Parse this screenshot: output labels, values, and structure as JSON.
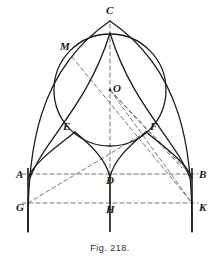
{
  "figure": {
    "caption": "Fig. 218.",
    "canvas": {
      "width": 220,
      "height": 269
    },
    "colors": {
      "ink": "#1a1a1a",
      "construction": "#666666",
      "background": "#ffffff"
    },
    "stroke": {
      "solid_width": 1.3,
      "dashed_width": 0.9,
      "dash_pattern": "4,3"
    }
  },
  "points": [
    {
      "id": "C",
      "label": "C",
      "x": 110,
      "y": 21,
      "label_x": 106,
      "label_y": 14,
      "role": "apex"
    },
    {
      "id": "M",
      "label": "M",
      "x": 72,
      "y": 57,
      "label_x": 60,
      "label_y": 50,
      "role": "arc-tangency-left"
    },
    {
      "id": "O",
      "label": "O",
      "x": 110,
      "y": 90,
      "label_x": 113,
      "label_y": 92,
      "role": "circle-center"
    },
    {
      "id": "E",
      "label": "E",
      "x": 75,
      "y": 132,
      "label_x": 63,
      "label_y": 130,
      "role": "cusp-left"
    },
    {
      "id": "F",
      "label": "F",
      "x": 146,
      "y": 132,
      "label_x": 150,
      "label_y": 130,
      "role": "cusp-right"
    },
    {
      "id": "A",
      "label": "A",
      "x": 28,
      "y": 174,
      "label_x": 16,
      "label_y": 178,
      "role": "springing-left"
    },
    {
      "id": "D",
      "label": "D",
      "x": 110,
      "y": 174,
      "label_x": 106,
      "label_y": 184,
      "role": "springing-center"
    },
    {
      "id": "B",
      "label": "B",
      "x": 192,
      "y": 174,
      "label_x": 199,
      "label_y": 178,
      "role": "springing-right"
    },
    {
      "id": "G",
      "label": "G",
      "x": 28,
      "y": 203,
      "label_x": 16,
      "label_y": 211,
      "role": "base-left"
    },
    {
      "id": "H",
      "label": "H",
      "x": 110,
      "y": 203,
      "label_x": 106,
      "label_y": 213,
      "role": "base-center"
    },
    {
      "id": "K",
      "label": "K",
      "x": 192,
      "y": 203,
      "label_x": 199,
      "label_y": 211,
      "role": "base-right"
    }
  ],
  "circle": {
    "name": "inscribed-circle",
    "center_x": 110,
    "center_y": 90,
    "radius": 56
  },
  "dashed_lines": [
    {
      "name": "line-A-D-B",
      "x1": 22,
      "y1": 174,
      "x2": 198,
      "y2": 174
    },
    {
      "name": "line-G-H-K",
      "x1": 22,
      "y1": 203,
      "x2": 198,
      "y2": 203
    },
    {
      "name": "axis-C-H",
      "x1": 110,
      "y1": 24,
      "x2": 110,
      "y2": 232
    },
    {
      "name": "line-M-O-K",
      "x1": 72,
      "y1": 57,
      "x2": 192,
      "y2": 203
    },
    {
      "name": "line-G-O",
      "x1": 28,
      "y1": 203,
      "x2": 146,
      "y2": 132
    },
    {
      "name": "line-O-K",
      "x1": 110,
      "y1": 90,
      "x2": 192,
      "y2": 203
    },
    {
      "name": "line-O-B",
      "x1": 110,
      "y1": 90,
      "x2": 192,
      "y2": 176
    },
    {
      "name": "line-O-F-ext",
      "x1": 110,
      "y1": 90,
      "x2": 182,
      "y2": 168
    }
  ],
  "verticals": [
    {
      "name": "pier-left",
      "x": 28,
      "y1": 168,
      "y2": 232
    },
    {
      "name": "pier-center",
      "x": 110,
      "y1": 178,
      "y2": 232
    },
    {
      "name": "pier-right",
      "x": 192,
      "y1": 168,
      "y2": 232
    }
  ],
  "arcs": [
    {
      "name": "outer-arch-left",
      "d": "M 28 232 C 27 150 38 70 110 21"
    },
    {
      "name": "outer-arch-right",
      "d": "M 192 232 C 193 150 182 70 110 21"
    },
    {
      "name": "inner-arch-left",
      "d": "M 30 178 C 44 140 88 105 110 33"
    },
    {
      "name": "inner-arch-right",
      "d": "M 190 178 C 176 140 132 105 110 33"
    },
    {
      "name": "foil-left-outer",
      "d": "M 28 178 C 34 162 58 146 75 132"
    },
    {
      "name": "foil-left-inner",
      "d": "M 75 132 C 92 146 106 160 110 177"
    },
    {
      "name": "foil-right-outer",
      "d": "M 192 178 C 186 162 163 146 146 132"
    },
    {
      "name": "foil-right-inner",
      "d": "M 146 132 C 129 146 114 160 110 177"
    }
  ]
}
